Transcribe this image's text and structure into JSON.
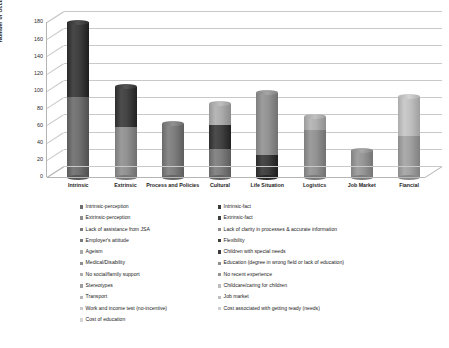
{
  "chart_data": {
    "type": "bar",
    "title": "",
    "subtitle": "",
    "xlabel": "",
    "ylabel": "Number of Occurance",
    "ylim": [
      0,
      180
    ],
    "yticks": [
      0,
      20,
      40,
      60,
      80,
      100,
      120,
      140,
      160,
      180
    ],
    "grid": true,
    "stacked": true,
    "legend_position": "bottom",
    "categories": [
      "Intrinsic",
      "Extrinsic",
      "Process and Policies",
      "Cultural",
      "Life Situation",
      "Logistics",
      "Job Market",
      "Fiancial"
    ],
    "totals": [
      180,
      105,
      62,
      85,
      98,
      70,
      31,
      93
    ],
    "series": [
      {
        "name": "Intrinsic-perception",
        "color": "#6d6d6d",
        "values": [
          93,
          0,
          0,
          0,
          0,
          0,
          0,
          0
        ]
      },
      {
        "name": "Intrinsic-fact",
        "color": "#3b3b3b",
        "values": [
          87,
          0,
          0,
          0,
          0,
          0,
          0,
          0
        ]
      },
      {
        "name": "Extrinsic-perception",
        "color": "#8d8d8d",
        "values": [
          0,
          58,
          0,
          0,
          0,
          0,
          0,
          0
        ]
      },
      {
        "name": "Extrinsic-fact",
        "color": "#3f3f3f",
        "values": [
          0,
          47,
          0,
          0,
          0,
          0,
          0,
          0
        ]
      },
      {
        "name": "Lack of assistance from JSA",
        "color": "#7b7b7b",
        "values": [
          0,
          0,
          62,
          0,
          0,
          0,
          0,
          0
        ]
      },
      {
        "name": "Lack of clarity in processes & accurate information",
        "color": "#8a8a8a",
        "values": [
          0,
          0,
          0,
          0,
          0,
          0,
          0,
          0
        ]
      },
      {
        "name": "Employer's attitude",
        "color": "#7a7a7a",
        "values": [
          0,
          0,
          0,
          33,
          0,
          0,
          0,
          0
        ]
      },
      {
        "name": "Flexibility",
        "color": "#3f3f3f",
        "values": [
          0,
          0,
          0,
          27,
          0,
          0,
          0,
          0
        ]
      },
      {
        "name": "Ageism",
        "color": "#a9a9a9",
        "values": [
          0,
          0,
          0,
          25,
          0,
          0,
          0,
          0
        ]
      },
      {
        "name": "Children with special needs",
        "color": "#3c3c3c",
        "values": [
          0,
          0,
          0,
          0,
          25,
          0,
          0,
          0
        ]
      },
      {
        "name": "Medical/Disability",
        "color": "#8f8f8f",
        "values": [
          0,
          0,
          0,
          0,
          73,
          0,
          0,
          0
        ]
      },
      {
        "name": "Education (degree in wrong field or lack of education)",
        "color": "#8f8f8f",
        "values": [
          0,
          0,
          0,
          0,
          0,
          55,
          0,
          0
        ]
      },
      {
        "name": "No social/family support",
        "color": "#acacac",
        "values": [
          0,
          0,
          0,
          0,
          0,
          15,
          0,
          0
        ]
      },
      {
        "name": "No recent experience",
        "color": "#939393",
        "values": [
          0,
          0,
          0,
          0,
          0,
          0,
          31,
          0
        ]
      },
      {
        "name": "Stereotypes",
        "color": "#9e9e9e",
        "values": [
          0,
          0,
          0,
          0,
          0,
          0,
          0,
          48
        ]
      },
      {
        "name": "Childcare/caring for children",
        "color": "#bdbdbd",
        "values": [
          0,
          0,
          0,
          0,
          0,
          0,
          0,
          45
        ]
      },
      {
        "name": "Transport",
        "color": "#b5b5b5",
        "values": [
          0,
          0,
          0,
          0,
          0,
          0,
          0,
          0
        ]
      },
      {
        "name": "Job market",
        "color": "#bfbfbf",
        "values": [
          0,
          0,
          0,
          0,
          0,
          0,
          0,
          0
        ]
      },
      {
        "name": "Work and income test (no-incentive)",
        "color": "#c9c9c9",
        "values": [
          0,
          0,
          0,
          0,
          0,
          0,
          0,
          0
        ]
      },
      {
        "name": "Cost associated with getting ready (needs)",
        "color": "#cfcfcf",
        "values": [
          0,
          0,
          0,
          0,
          0,
          0,
          0,
          0
        ]
      },
      {
        "name": "Cost of education",
        "color": "#d6d6d6",
        "values": [
          0,
          0,
          0,
          0,
          0,
          0,
          0,
          0
        ]
      }
    ],
    "bars": [
      {
        "category": "Intrinsic",
        "segments": [
          {
            "value": 93,
            "color": "#6d6d6d"
          },
          {
            "value": 87,
            "color": "#3b3b3b"
          }
        ]
      },
      {
        "category": "Extrinsic",
        "segments": [
          {
            "value": 58,
            "color": "#8d8d8d"
          },
          {
            "value": 47,
            "color": "#3f3f3f"
          }
        ]
      },
      {
        "category": "Process and Policies",
        "segments": [
          {
            "value": 62,
            "color": "#7b7b7b"
          }
        ]
      },
      {
        "category": "Cultural",
        "segments": [
          {
            "value": 33,
            "color": "#7a7a7a"
          },
          {
            "value": 27,
            "color": "#3f3f3f"
          },
          {
            "value": 25,
            "color": "#a9a9a9"
          }
        ]
      },
      {
        "category": "Life Situation",
        "segments": [
          {
            "value": 25,
            "color": "#3c3c3c"
          },
          {
            "value": 73,
            "color": "#8f8f8f"
          }
        ]
      },
      {
        "category": "Logistics",
        "segments": [
          {
            "value": 55,
            "color": "#8f8f8f"
          },
          {
            "value": 15,
            "color": "#acacac"
          }
        ]
      },
      {
        "category": "Job Market",
        "segments": [
          {
            "value": 31,
            "color": "#939393"
          }
        ]
      },
      {
        "category": "Fiancial",
        "segments": [
          {
            "value": 48,
            "color": "#9e9e9e"
          },
          {
            "value": 45,
            "color": "#bdbdbd"
          }
        ]
      }
    ]
  },
  "legend": {
    "left_column": [
      {
        "label": "Intrinsic-perception",
        "color": "#6d6d6d"
      },
      {
        "label": "Extrinsic-perception",
        "color": "#8d8d8d"
      },
      {
        "label": "Lack of assistance from JSA",
        "color": "#7b7b7b"
      },
      {
        "label": "Employer's attitude",
        "color": "#7a7a7a"
      },
      {
        "label": "Ageism",
        "color": "#a9a9a9"
      },
      {
        "label": "Medical/Disability",
        "color": "#8f8f8f"
      },
      {
        "label": "No social/family support",
        "color": "#acacac"
      },
      {
        "label": "Stereotypes",
        "color": "#9e9e9e"
      },
      {
        "label": "Transport",
        "color": "#b5b5b5"
      },
      {
        "label": "Work and income test (no-incentive)",
        "color": "#c9c9c9"
      },
      {
        "label": "Cost of education",
        "color": "#d6d6d6"
      }
    ],
    "right_column": [
      {
        "label": "Intrinsic-fact",
        "color": "#3b3b3b"
      },
      {
        "label": "Extrinsic-fact",
        "color": "#3f3f3f"
      },
      {
        "label": "Lack of clarity in processes & accurate information",
        "color": "#8a8a8a"
      },
      {
        "label": "Flexibility",
        "color": "#3f3f3f"
      },
      {
        "label": "Children with special needs",
        "color": "#3c3c3c"
      },
      {
        "label": "Education (degree in wrong field or lack of education)",
        "color": "#8f8f8f"
      },
      {
        "label": "No recent experience",
        "color": "#939393"
      },
      {
        "label": "Childcare/caring for children",
        "color": "#bdbdbd"
      },
      {
        "label": "Job market",
        "color": "#bfbfbf"
      },
      {
        "label": "Cost associated with getting ready (needs)",
        "color": "#cfcfcf"
      }
    ]
  }
}
